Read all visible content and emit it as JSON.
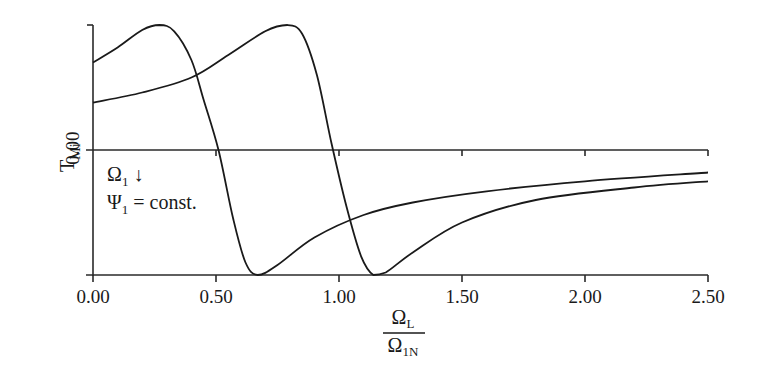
{
  "chart_data": {
    "type": "line",
    "title": "",
    "xlabel": "Ω_L / Ω_1N",
    "xlabel_numerator": "Ω",
    "xlabel_numerator_sub": "L",
    "xlabel_denominator": "Ω",
    "xlabel_denominator_sub": "1N",
    "ylabel": "T_Mi",
    "ylabel_main": "T",
    "ylabel_sub": "Mi",
    "y_tick_label": "0.00",
    "xlim": [
      0.0,
      2.5
    ],
    "ylim": [
      -1.0,
      1.0
    ],
    "x_ticks": [
      0.0,
      0.5,
      1.0,
      1.5,
      2.0,
      2.5
    ],
    "x_tick_labels": [
      "0.00",
      "0.50",
      "1.00",
      "1.50",
      "2.00",
      "2.50"
    ],
    "grid": false,
    "annotations": [
      {
        "text": "Ω",
        "sub": "1",
        "suffix": " ↓"
      },
      {
        "text": "Ψ",
        "sub": "1",
        "suffix": " = const."
      }
    ],
    "series": [
      {
        "name": "curve-1",
        "x": [
          0.0,
          0.1,
          0.2,
          0.27,
          0.33,
          0.4,
          0.45,
          0.51,
          0.57,
          0.62,
          0.67,
          0.75,
          0.9,
          1.1,
          1.3,
          1.6,
          2.0,
          2.5
        ],
        "y": [
          0.7,
          0.82,
          0.96,
          1.0,
          0.95,
          0.72,
          0.4,
          0.0,
          -0.55,
          -0.9,
          -1.0,
          -0.92,
          -0.7,
          -0.52,
          -0.42,
          -0.33,
          -0.25,
          -0.18
        ]
      },
      {
        "name": "curve-2",
        "x": [
          0.0,
          0.2,
          0.4,
          0.55,
          0.7,
          0.79,
          0.85,
          0.91,
          0.97,
          1.03,
          1.09,
          1.14,
          1.19,
          1.3,
          1.5,
          1.8,
          2.2,
          2.5
        ],
        "y": [
          0.38,
          0.46,
          0.58,
          0.76,
          0.95,
          1.0,
          0.93,
          0.6,
          0.05,
          -0.45,
          -0.85,
          -1.0,
          -0.98,
          -0.82,
          -0.58,
          -0.4,
          -0.3,
          -0.25
        ]
      }
    ]
  }
}
